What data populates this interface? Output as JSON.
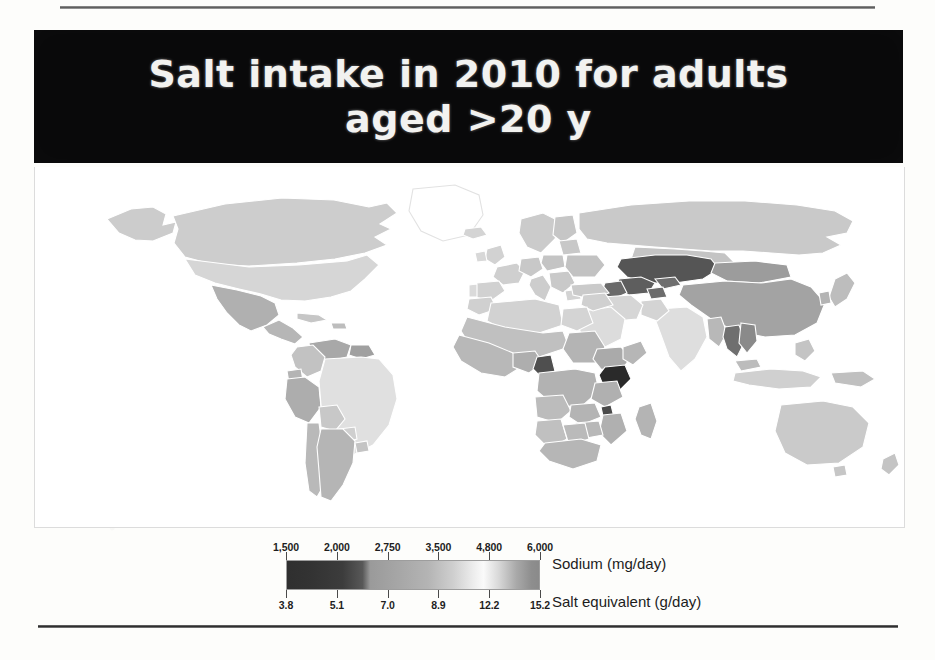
{
  "figure": {
    "title_line1": "Salt intake in 2010 for adults",
    "title_line2": "aged >20 y",
    "title_full": "Salt intake in 2010 for adults aged >20 y"
  },
  "legend": {
    "sodium_label": "Sodium (mg/day)",
    "salt_label": "Salt equivalent (g/day)",
    "sodium_ticks": [
      "1,500",
      "2,000",
      "2,750",
      "3,500",
      "4,800",
      "6,000"
    ],
    "salt_ticks": [
      "3.8",
      "5.1",
      "7.0",
      "8.9",
      "12.2",
      "15.2"
    ]
  },
  "chart_data": {
    "type": "heatmap",
    "title": "Salt intake in 2010 for adults aged >20 y",
    "subtitle": "",
    "xlabel": "",
    "ylabel": "",
    "map_projection": "world-choropleth",
    "colorbar": {
      "orientation": "horizontal",
      "primary_axis_label": "Sodium (mg/day)",
      "primary_axis_ticks": [
        1500,
        2000,
        2750,
        3500,
        4800,
        6000
      ],
      "primary_axis_tick_labels": [
        "1,500",
        "2,000",
        "2,750",
        "3,500",
        "4,800",
        "6,000"
      ],
      "secondary_axis_label": "Salt equivalent (g/day)",
      "secondary_axis_ticks": [
        3.8,
        5.1,
        7.0,
        8.9,
        12.2,
        15.2
      ],
      "secondary_axis_tick_labels": [
        "3.8",
        "5.1",
        "7.0",
        "8.9",
        "12.2",
        "15.2"
      ],
      "tick_positions_pct": [
        0,
        20,
        40,
        60,
        80,
        100
      ],
      "gradient_stops_hex": [
        "#2f2f2f",
        "#3c3c3c",
        "#9a9a9a",
        "#b4b4b4",
        "#ededed",
        "#fafafa",
        "#a9a9a9",
        "#8a8a8a"
      ],
      "scale_note": "1 g salt = 393 mg sodium"
    },
    "grid": false,
    "legend_position": "bottom-center",
    "regions": [
      {
        "name": "Kazakhstan",
        "shade_hex": "#555555",
        "band": "high"
      },
      {
        "name": "Uzbekistan",
        "shade_hex": "#5e5e5e",
        "band": "high"
      },
      {
        "name": "Turkmenistan",
        "shade_hex": "#6a6a6a",
        "band": "high"
      },
      {
        "name": "Kyrgyzstan",
        "shade_hex": "#6e6e6e",
        "band": "high"
      },
      {
        "name": "Kenya",
        "shade_hex": "#2a2a2a",
        "band": "very-low"
      },
      {
        "name": "Cameroon",
        "shade_hex": "#4f4f4f",
        "band": "low"
      },
      {
        "name": "Malawi",
        "shade_hex": "#4a4a4a",
        "band": "low"
      },
      {
        "name": "China",
        "shade_hex": "#a3a3a3",
        "band": "mid-high"
      },
      {
        "name": "Mongolia",
        "shade_hex": "#9c9c9c",
        "band": "mid-high"
      },
      {
        "name": "Thailand",
        "shade_hex": "#6f6f6f",
        "band": "low"
      },
      {
        "name": "Russia",
        "shade_hex": "#c9c9c9",
        "band": "mid"
      },
      {
        "name": "Europe",
        "shade_hex": "#cfcfcf",
        "band": "mid"
      },
      {
        "name": "United States",
        "shade_hex": "#d6d6d6",
        "band": "mid"
      },
      {
        "name": "Canada",
        "shade_hex": "#cdcdcd",
        "band": "mid"
      },
      {
        "name": "Mexico",
        "shade_hex": "#b0b0b0",
        "band": "mid"
      },
      {
        "name": "Brazil",
        "shade_hex": "#e0e0e0",
        "band": "mid-light"
      },
      {
        "name": "Argentina",
        "shade_hex": "#b5b5b5",
        "band": "mid"
      },
      {
        "name": "Peru",
        "shade_hex": "#adadad",
        "band": "mid"
      },
      {
        "name": "Venezuela",
        "shade_hex": "#a8a8a8",
        "band": "mid"
      },
      {
        "name": "Sub-Saharan Africa",
        "shade_hex": "#b8b8b8",
        "band": "mid"
      },
      {
        "name": "North Africa",
        "shade_hex": "#d2d2d2",
        "band": "mid"
      },
      {
        "name": "India",
        "shade_hex": "#dedede",
        "band": "mid-light"
      },
      {
        "name": "Saudi Arabia",
        "shade_hex": "#dcdcdc",
        "band": "mid-light"
      },
      {
        "name": "Indonesia",
        "shade_hex": "#d0d0d0",
        "band": "mid"
      },
      {
        "name": "Australia",
        "shade_hex": "#cacaca",
        "band": "mid"
      },
      {
        "name": "Japan",
        "shade_hex": "#bdbdbd",
        "band": "mid"
      }
    ]
  }
}
